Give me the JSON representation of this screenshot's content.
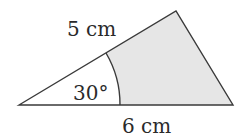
{
  "diagram": {
    "type": "triangle-with-shaded-region",
    "labels": {
      "side_top": "5 cm",
      "side_bottom": "6 cm",
      "angle": "30°"
    },
    "geometry": {
      "vertices": {
        "left": [
          19,
          105
        ],
        "top": [
          176,
          11
        ],
        "right": [
          233,
          105
        ]
      },
      "sector_radius": 101,
      "angle_degrees": 30
    },
    "colors": {
      "stroke": "#3a3a3a",
      "shade": "#e6e6e6",
      "background": "#ffffff"
    }
  }
}
